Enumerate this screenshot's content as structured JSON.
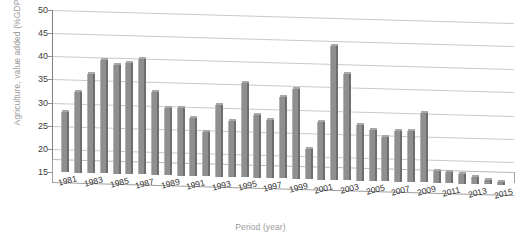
{
  "chart_data": {
    "type": "bar",
    "title": "",
    "subtitle": "",
    "xlabel": "Period (year)",
    "ylabel": "Agriculture, value added (%GDP)",
    "ylim": [
      15,
      50
    ],
    "ytick_values": [
      15,
      20,
      25,
      30,
      35,
      40,
      45,
      50
    ],
    "ytick_labels": [
      "15",
      "20",
      "25",
      "30",
      "35",
      "40",
      "45",
      "50"
    ],
    "grid": true,
    "legend": false,
    "legend_position": "none",
    "style": "3d-column",
    "bar_color": "#8f8f8f",
    "bar_edge_color": "#6e6e6e",
    "grid_color": "#c9c9c9",
    "axis_color": "#7e7e7e",
    "label_color": "#2f2f2f",
    "axis_title_color": "#9a9a9a",
    "categories": [
      "1981",
      "1982",
      "1983",
      "1984",
      "1985",
      "1986",
      "1987",
      "1988",
      "1989",
      "1990",
      "1991",
      "1992",
      "1993",
      "1994",
      "1995",
      "1996",
      "1997",
      "1998",
      "1999",
      "2000",
      "2001",
      "2002",
      "2003",
      "2004",
      "2005",
      "2006",
      "2007",
      "2008",
      "2009",
      "2010",
      "2011",
      "2012",
      "2013",
      "2014",
      "2015"
    ],
    "xtick_labels": [
      "1981",
      "1983",
      "1985",
      "1987",
      "1989",
      "1991",
      "1993",
      "1995",
      "1997",
      "1999",
      "2001",
      "2003",
      "2005",
      "2007",
      "2009",
      "2011",
      "2013",
      "2015"
    ],
    "xtick_label_every": 2,
    "values": [
      28.0,
      32.5,
      36.5,
      39.5,
      38.5,
      39.0,
      40.0,
      33.0,
      29.5,
      29.5,
      27.5,
      24.5,
      30.5,
      27.0,
      35.5,
      28.5,
      27.5,
      32.5,
      34.5,
      21.5,
      27.5,
      44.0,
      38.0,
      27.0,
      26.0,
      24.5,
      26.0,
      26.0,
      30.0,
      17.5,
      17.5,
      17.0,
      16.5,
      16.0,
      15.5
    ]
  }
}
